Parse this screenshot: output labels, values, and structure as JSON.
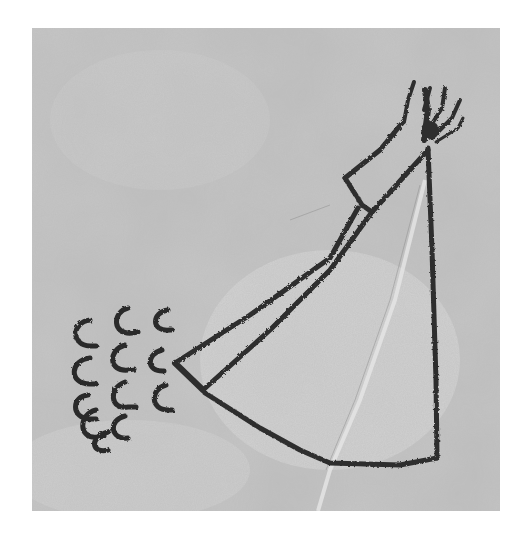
{
  "image": {
    "subject": "Rock drawing of a tipi with a hand at the apex and rows of hoof-print marks",
    "alt": "Petroglyph: tipi outline with extended pole ending in a hand, beside a cluster of C-shaped hoof marks",
    "palette": {
      "background": "#ffffff",
      "rock": "#c4c4c4",
      "rock_light": "#d8d8d8",
      "rock_dark": "#9e9e9e",
      "ink": "#2e2e2e"
    },
    "hoof_marks": {
      "columns": 3,
      "count": 14
    }
  }
}
